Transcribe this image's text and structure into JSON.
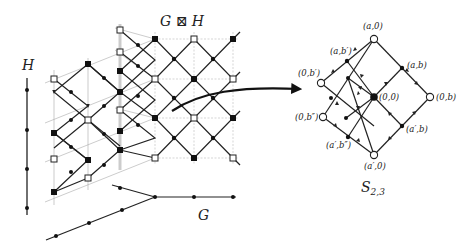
{
  "figure": {
    "title_product": "G ⊠ H",
    "label_H": "H",
    "label_G": "G",
    "label_result": "S",
    "label_result_sub": "2,3"
  },
  "result_graph": {
    "nodes": [
      {
        "id": "a0",
        "label": "(a,0)",
        "x": 374,
        "y": 39,
        "style": "open"
      },
      {
        "id": "ab1",
        "label": "(a,b′)",
        "x": 347,
        "y": 61,
        "style": "filled"
      },
      {
        "id": "0b1",
        "label": "(0,b′)",
        "x": 321,
        "y": 83,
        "style": "open"
      },
      {
        "id": "ab",
        "label": "(a,b)",
        "x": 402,
        "y": 68,
        "style": "filled"
      },
      {
        "id": "00",
        "label": "(0,0)",
        "x": 374,
        "y": 97,
        "style": "big"
      },
      {
        "id": "0b",
        "label": "(0,b)",
        "x": 430,
        "y": 97,
        "style": "open"
      },
      {
        "id": "0b2",
        "label": "(0,b″)",
        "x": 323,
        "y": 117,
        "style": "open"
      },
      {
        "id": "a1b2",
        "label": "(a′,b″)",
        "x": 348,
        "y": 137,
        "style": "filled"
      },
      {
        "id": "a10",
        "label": "(a′,0)",
        "x": 374,
        "y": 155,
        "style": "open"
      },
      {
        "id": "a1b",
        "label": "(a′,b)",
        "x": 402,
        "y": 126,
        "style": "filled"
      }
    ]
  },
  "colors": {
    "ink": "#222222",
    "guide": "#aaaaaa",
    "background": "#ffffff"
  }
}
